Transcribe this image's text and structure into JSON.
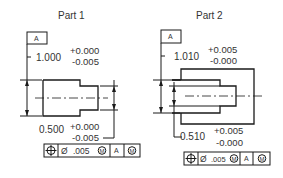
{
  "parts": [
    {
      "title": "Part 1",
      "datum_label": "A",
      "outer_dim": {
        "nominal": "1.000",
        "tol_plus": "+0.000",
        "tol_minus": "-0.005"
      },
      "inner_dim": {
        "nominal": "0.500",
        "tol_plus": "+0.000",
        "tol_minus": "-0.005"
      },
      "feature_control_frame": {
        "symbol": "position",
        "diameter_symbol": "Ø",
        "tolerance": ".005",
        "tolerance_modifier": "M",
        "datum": "A",
        "datum_modifier": "M"
      }
    },
    {
      "title": "Part 2",
      "datum_label": "A",
      "outer_dim": {
        "nominal": "1.010",
        "tol_plus": "+0.005",
        "tol_minus": "-0.000"
      },
      "inner_dim": {
        "nominal": "0.510",
        "tol_plus": "+0.005",
        "tol_minus": "-0.000"
      },
      "feature_control_frame": {
        "symbol": "position",
        "diameter_symbol": "Ø",
        "tolerance": ".005",
        "tolerance_modifier": "M",
        "datum": "A",
        "datum_modifier": "M"
      }
    }
  ],
  "colors": {
    "line": "#1a1a1a",
    "text": "#333333",
    "background": "#ffffff"
  }
}
